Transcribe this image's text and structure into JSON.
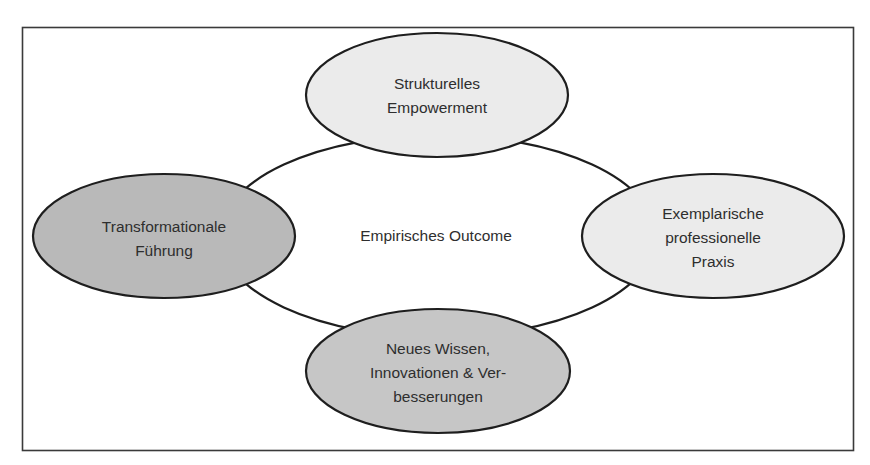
{
  "diagram": {
    "center": {
      "label": "Empirisches Outcome"
    },
    "nodes": [
      {
        "id": "top",
        "lines": [
          "Strukturelles",
          "Empowerment"
        ],
        "fill": "#ebebeb"
      },
      {
        "id": "left",
        "lines": [
          "Transformationale",
          "Führung"
        ],
        "fill": "#b9b9b9"
      },
      {
        "id": "right",
        "lines": [
          "Exemplarische",
          "professionelle",
          "Praxis"
        ],
        "fill": "#ebebeb"
      },
      {
        "id": "bottom",
        "lines": [
          "Neues Wissen,",
          "Innovationen & Ver-",
          "besserungen"
        ],
        "fill": "#c6c6c6"
      }
    ],
    "colors": {
      "stroke": "#1e1e1e",
      "frame": "#3a3a3a",
      "background": "#ffffff"
    }
  }
}
